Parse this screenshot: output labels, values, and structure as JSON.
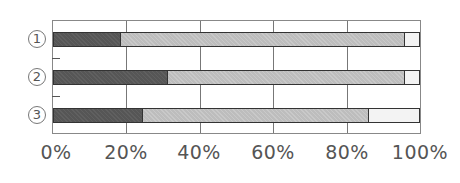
{
  "chart_data": {
    "type": "bar",
    "orientation": "horizontal",
    "stacked": true,
    "normalized": true,
    "title": "",
    "xlabel": "",
    "ylabel": "",
    "categories": [
      "①",
      "②",
      "③"
    ],
    "series": [
      {
        "name": "segment-1",
        "color": "#565656",
        "values": [
          18,
          31,
          24
        ]
      },
      {
        "name": "segment-2",
        "color": "#bdbdbd",
        "values": [
          78,
          65,
          62
        ]
      },
      {
        "name": "segment-3",
        "color": "#f3f3f3",
        "values": [
          4,
          4,
          14
        ]
      }
    ],
    "xlim": [
      0,
      100
    ],
    "x_ticks": [
      "0%",
      "20%",
      "40%",
      "60%",
      "80%",
      "100%"
    ],
    "grid": {
      "vertical": true,
      "horizontal": false
    },
    "legend": null
  },
  "labels": {
    "rows": [
      "1",
      "2",
      "3"
    ],
    "x_ticks": [
      "0%",
      "20%",
      "40%",
      "60%",
      "80%",
      "100%"
    ]
  }
}
